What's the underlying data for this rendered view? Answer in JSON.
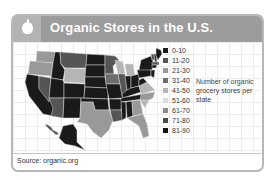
{
  "header": {
    "title": "Organic Stores in the U.S.",
    "icon": "apple-icon"
  },
  "footer": {
    "source": "Source: organic.org"
  },
  "chart_data": {
    "type": "heatmap",
    "title": "Organic Stores in the U.S.",
    "legend_title": "Number of organic grocery stores per state",
    "legend_position": "right",
    "bins": [
      {
        "label": "0-10",
        "color": "#1a1a1a"
      },
      {
        "label": "11-20",
        "color": "#555555"
      },
      {
        "label": "21-30",
        "color": "#999999"
      },
      {
        "label": "31-40",
        "color": "#6e6e6e"
      },
      {
        "label": "41-50",
        "color": "#b5b5b5"
      },
      {
        "label": "51-60",
        "color": "#dcdcdc"
      },
      {
        "label": "61-70",
        "color": "#8a8a8a"
      },
      {
        "label": "71-80",
        "color": "#4a4a4a"
      },
      {
        "label": "81-90",
        "color": "#111111"
      }
    ],
    "states": [
      {
        "name": "WA",
        "bin": "21-30"
      },
      {
        "name": "OR",
        "bin": "21-30"
      },
      {
        "name": "CA",
        "bin": "0-10"
      },
      {
        "name": "NV",
        "bin": "11-20"
      },
      {
        "name": "ID",
        "bin": "0-10"
      },
      {
        "name": "MT",
        "bin": "11-20"
      },
      {
        "name": "WY",
        "bin": "41-50"
      },
      {
        "name": "UT",
        "bin": "0-10"
      },
      {
        "name": "AZ",
        "bin": "11-20"
      },
      {
        "name": "CO",
        "bin": "0-10"
      },
      {
        "name": "NM",
        "bin": "0-10"
      },
      {
        "name": "ND",
        "bin": "0-10"
      },
      {
        "name": "SD",
        "bin": "0-10"
      },
      {
        "name": "NE",
        "bin": "0-10"
      },
      {
        "name": "KS",
        "bin": "0-10"
      },
      {
        "name": "OK",
        "bin": "0-10"
      },
      {
        "name": "TX",
        "bin": "21-30"
      },
      {
        "name": "MN",
        "bin": "11-20"
      },
      {
        "name": "IA",
        "bin": "31-40"
      },
      {
        "name": "MO",
        "bin": "0-10"
      },
      {
        "name": "AR",
        "bin": "0-10"
      },
      {
        "name": "LA",
        "bin": "11-20"
      },
      {
        "name": "WI",
        "bin": "41-50"
      },
      {
        "name": "IL",
        "bin": "11-20"
      },
      {
        "name": "MI",
        "bin": "41-50"
      },
      {
        "name": "IN",
        "bin": "0-10"
      },
      {
        "name": "OH",
        "bin": "0-10"
      },
      {
        "name": "KY",
        "bin": "0-10"
      },
      {
        "name": "TN",
        "bin": "0-10"
      },
      {
        "name": "MS",
        "bin": "0-10"
      },
      {
        "name": "AL",
        "bin": "0-10"
      },
      {
        "name": "GA",
        "bin": "21-30"
      },
      {
        "name": "FL",
        "bin": "21-30"
      },
      {
        "name": "SC",
        "bin": "41-50"
      },
      {
        "name": "NC",
        "bin": "21-30"
      },
      {
        "name": "VA",
        "bin": "41-50"
      },
      {
        "name": "WV",
        "bin": "0-10"
      },
      {
        "name": "PA",
        "bin": "0-10"
      },
      {
        "name": "NY",
        "bin": "0-10"
      },
      {
        "name": "VT",
        "bin": "11-20"
      },
      {
        "name": "NH",
        "bin": "0-10"
      },
      {
        "name": "ME",
        "bin": "0-10"
      },
      {
        "name": "MA",
        "bin": "11-20"
      },
      {
        "name": "CT",
        "bin": "0-10"
      },
      {
        "name": "NJ",
        "bin": "0-10"
      },
      {
        "name": "AK",
        "bin": "0-10"
      },
      {
        "name": "HI",
        "bin": "11-20"
      }
    ]
  }
}
